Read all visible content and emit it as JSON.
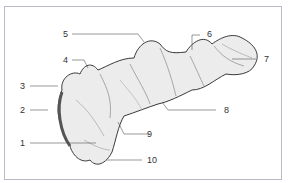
{
  "diagram": {
    "labels": [
      {
        "id": "1",
        "text": "1"
      },
      {
        "id": "2",
        "text": "2"
      },
      {
        "id": "3",
        "text": "3"
      },
      {
        "id": "4",
        "text": "4"
      },
      {
        "id": "5",
        "text": "5"
      },
      {
        "id": "6",
        "text": "6"
      },
      {
        "id": "7",
        "text": "7"
      },
      {
        "id": "8",
        "text": "8"
      },
      {
        "id": "9",
        "text": "9"
      },
      {
        "id": "10",
        "text": "10"
      }
    ],
    "colors": {
      "frame": "#b9bcc8",
      "line": "#555555",
      "fill": "#e9e9e9",
      "shade": "#8a8a8a"
    }
  }
}
